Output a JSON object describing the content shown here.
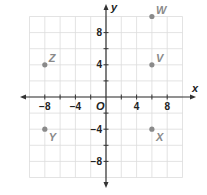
{
  "diagram": {
    "type": "coordinate-plane",
    "x_axis_label": "x",
    "y_axis_label": "y",
    "origin_label": "O",
    "range": {
      "xmin": -10,
      "xmax": 10,
      "ymin": -10,
      "ymax": 10
    },
    "grid_step": 2,
    "x_tick_labels": [
      {
        "value": -8,
        "text": "−8"
      },
      {
        "value": -4,
        "text": "−4"
      },
      {
        "value": 4,
        "text": "4"
      },
      {
        "value": 8,
        "text": "8"
      }
    ],
    "y_tick_labels": [
      {
        "value": 8,
        "text": "8"
      },
      {
        "value": 4,
        "text": "4"
      },
      {
        "value": -4,
        "text": "−4"
      },
      {
        "value": -8,
        "text": "−8"
      }
    ],
    "points": [
      {
        "label": "W",
        "x": 6,
        "y": 10,
        "label_pos": "upper-right"
      },
      {
        "label": "V",
        "x": 6,
        "y": 4,
        "label_pos": "upper-right"
      },
      {
        "label": "Z",
        "x": -8,
        "y": 4,
        "label_pos": "upper-right"
      },
      {
        "label": "Y",
        "x": -8,
        "y": -4,
        "label_pos": "lower-right"
      },
      {
        "label": "X",
        "x": 6,
        "y": -4,
        "label_pos": "lower-right"
      }
    ],
    "colors": {
      "grid": "#dcdcdc",
      "axis": "#333333",
      "point": "#8a8a8a",
      "point_label": "#8a8a8a",
      "tick_label": "#222222"
    }
  }
}
